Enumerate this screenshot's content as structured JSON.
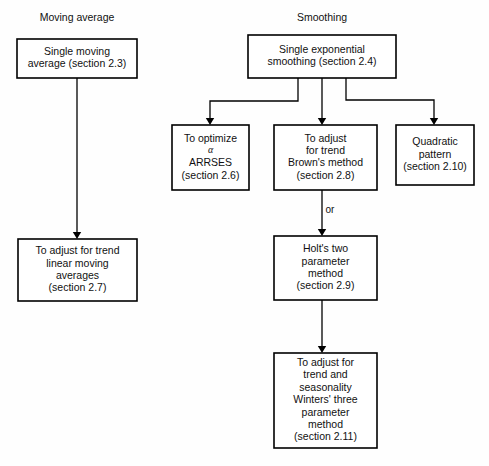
{
  "diagram": {
    "background_color": "#fefefe",
    "line_color": "#000000",
    "text_color": "#111111",
    "headings": [
      {
        "id": "heading-moving-average",
        "label": "Moving average",
        "x": 77,
        "y": 21
      },
      {
        "id": "heading-smoothing",
        "label": "Smoothing",
        "x": 322,
        "y": 21
      }
    ],
    "nodes": [
      {
        "id": "single-moving-average",
        "name": "node-single-moving-average",
        "x": 17,
        "y": 39,
        "w": 120,
        "h": 39,
        "lines": [
          "Single moving",
          "average (section 2.3)"
        ],
        "section": "2.3"
      },
      {
        "id": "single-exponential-smoothing",
        "name": "node-single-exponential-smoothing",
        "x": 248,
        "y": 35,
        "w": 148,
        "h": 43,
        "lines": [
          "Single exponential",
          "smoothing (section 2.4)"
        ],
        "section": "2.4"
      },
      {
        "id": "optimize-alpha-arrses",
        "name": "node-optimize-alpha-arrses",
        "x": 172,
        "y": 125,
        "w": 77,
        "h": 65,
        "lines": [
          "To optimize",
          "α",
          "ARRSES",
          "(section 2.6)"
        ],
        "greek_line_index": 1,
        "section": "2.6"
      },
      {
        "id": "adjust-trend-brown",
        "name": "node-adjust-for-trend-browns-method",
        "x": 274,
        "y": 125,
        "w": 103,
        "h": 65,
        "lines": [
          "To adjust",
          "for trend",
          "Brown's method",
          "(section 2.8)"
        ],
        "section": "2.8"
      },
      {
        "id": "quadratic-pattern",
        "name": "node-quadratic-pattern",
        "x": 396,
        "y": 125,
        "w": 78,
        "h": 60,
        "lines": [
          "Quadratic",
          "pattern",
          "(section 2.10)"
        ],
        "section": "2.10"
      },
      {
        "id": "adjust-trend-linear-moving-averages",
        "name": "node-adjust-for-trend-linear-moving-averages",
        "x": 18,
        "y": 239,
        "w": 119,
        "h": 62,
        "lines": [
          "To adjust for trend",
          "linear moving",
          "averages",
          "(section 2.7)"
        ],
        "section": "2.7"
      },
      {
        "id": "holts-two-parameter-method",
        "name": "node-holts-two-parameter-method",
        "x": 274,
        "y": 236,
        "w": 103,
        "h": 64,
        "lines": [
          "Holt's two",
          "parameter",
          "method",
          "(section 2.9)"
        ],
        "section": "2.9"
      },
      {
        "id": "winters-three-parameter-method",
        "name": "node-winters-three-parameter-method",
        "x": 274,
        "y": 353,
        "w": 103,
        "h": 95,
        "lines": [
          "To adjust for",
          "trend and",
          "seasonality",
          "Winters' three",
          "parameter",
          "method",
          "(section 2.11)"
        ],
        "section": "2.11"
      }
    ],
    "edges": [
      {
        "id": "edge-sma-to-linear-moving-averages",
        "name": "edge-single-moving-average-to-linear-moving-averages",
        "path": "M 77 78 L 77 235",
        "arrow_at": {
          "x": 77,
          "y": 239,
          "dir": "down"
        },
        "label": ""
      },
      {
        "id": "edge-ses-to-arrses",
        "name": "edge-smoothing-to-optimize-alpha",
        "path": "M 298 78 L 298 101 L 210 101 L 210 120",
        "arrow_at": {
          "x": 210,
          "y": 125,
          "dir": "down"
        },
        "label": ""
      },
      {
        "id": "edge-ses-to-brown",
        "name": "edge-smoothing-to-browns-method",
        "path": "M 322 78 L 322 120",
        "arrow_at": {
          "x": 322,
          "y": 125,
          "dir": "down"
        },
        "label": ""
      },
      {
        "id": "edge-ses-to-quadratic",
        "name": "edge-smoothing-to-quadratic-pattern",
        "path": "M 346 78 L 346 100 L 434 100 L 434 120",
        "arrow_at": {
          "x": 434,
          "y": 125,
          "dir": "down"
        },
        "label": ""
      },
      {
        "id": "edge-brown-to-holt",
        "name": "edge-browns-method-to-holts-method",
        "path": "M 322 190 L 322 231",
        "arrow_at": {
          "x": 322,
          "y": 236,
          "dir": "down"
        },
        "label": "or",
        "label_x": 330,
        "label_y": 213
      },
      {
        "id": "edge-holt-to-winters",
        "name": "edge-holts-method-to-winters-method",
        "path": "M 322 300 L 322 348",
        "arrow_at": {
          "x": 322,
          "y": 353,
          "dir": "down"
        },
        "label": ""
      }
    ]
  }
}
